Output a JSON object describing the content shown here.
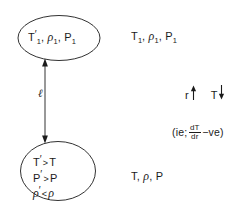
{
  "figure": {
    "type": "physics-schematic-diagram",
    "ink_color": "#1b1b1b",
    "background_color": "#ffffff"
  },
  "blob_top": {
    "shape": "ellipse",
    "temperature": "T",
    "temperature_prime": "′",
    "temperature_subscript": "1",
    "density": "ρ",
    "density_subscript": "1",
    "pressure": "P",
    "pressure_subscript": "1",
    "separator": ", "
  },
  "blob_bottom": {
    "shape": "circle",
    "rows": [
      {
        "left": "T",
        "prime": "′",
        "relation": ">",
        "right": "T"
      },
      {
        "left": "P",
        "prime": "′",
        "relation": ">",
        "right": "P"
      },
      {
        "left": "ρ",
        "prime": "′",
        "relation": "<",
        "right": "ρ"
      }
    ]
  },
  "ambient_top": {
    "temperature": "T",
    "temperature_subscript": "1",
    "density": "ρ",
    "density_subscript": "1",
    "pressure": "P",
    "pressure_subscript": "1"
  },
  "ambient_bottom": {
    "temperature": "T",
    "density": "ρ",
    "pressure": "P"
  },
  "displacement": {
    "label": "ℓ",
    "arrow_style": "double-headed-vertical"
  },
  "gradient_note": {
    "radius_symbol": "r",
    "radius_direction": "up",
    "temperature_symbol": "T",
    "temperature_direction": "down"
  },
  "derivative_note": {
    "open": "(ie;",
    "numerator": "dT",
    "denominator": "dr",
    "sign": "−ve",
    "close": ")"
  }
}
